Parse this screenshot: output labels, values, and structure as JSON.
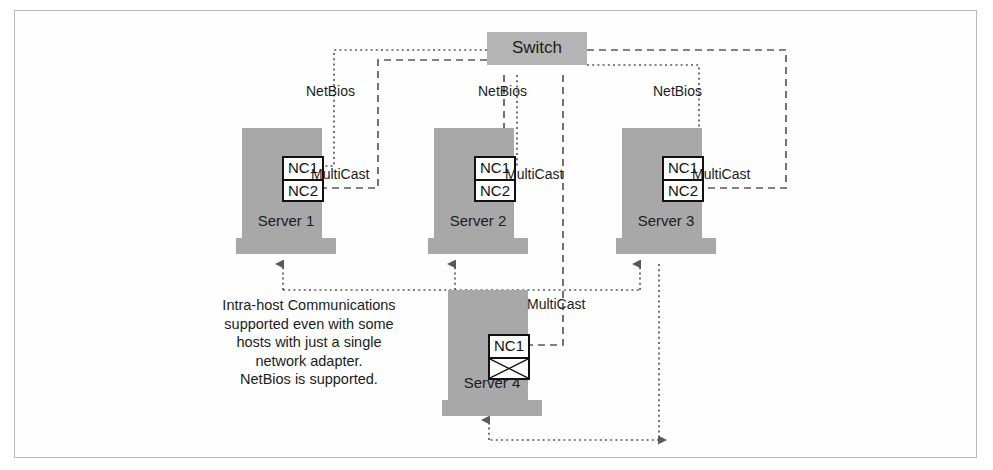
{
  "diagram": {
    "colors": {
      "server_fill": "#a8a8a8",
      "switch_fill": "#b4b4b4",
      "nic_border": "#111111",
      "nic_fill": "#ffffff",
      "line": "#4a4a4a",
      "frame_border": "#b9b9b9",
      "text": "#1c1c1c",
      "background": "#ffffff"
    },
    "switch": {
      "label": "Switch"
    },
    "servers": [
      {
        "id": "server-1",
        "label": "Server 1",
        "nics": [
          "NC1",
          "NC2"
        ],
        "nic_crossed": [
          false,
          false
        ],
        "netbios_label": "NetBios",
        "multicast_label": "MultiCast"
      },
      {
        "id": "server-2",
        "label": "Server 2",
        "nics": [
          "NC1",
          "NC2"
        ],
        "nic_crossed": [
          false,
          false
        ],
        "netbios_label": "NetBios",
        "multicast_label": "MultiCast"
      },
      {
        "id": "server-3",
        "label": "Server 3",
        "nics": [
          "NC1",
          "NC2"
        ],
        "nic_crossed": [
          false,
          false
        ],
        "netbios_label": "NetBios",
        "multicast_label": "MultiCast"
      },
      {
        "id": "server-4",
        "label": "Server 4",
        "nics": [
          "NC1",
          ""
        ],
        "nic_crossed": [
          false,
          true
        ],
        "netbios_label": "",
        "multicast_label": "MultiCast"
      }
    ],
    "caption": {
      "line1": "Intra-host Communications",
      "line2": "supported even with some",
      "line3": "hosts with just a single",
      "line4": "network adapter.",
      "line5": "NetBios is supported."
    },
    "legend_notes": {
      "dotted_means": "NetBios",
      "dashed_means": "MultiCast"
    }
  }
}
